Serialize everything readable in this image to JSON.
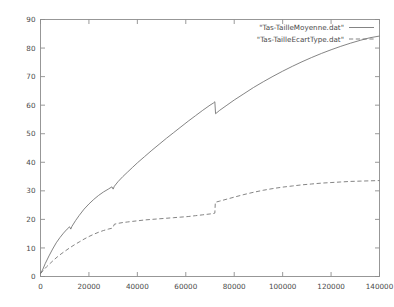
{
  "chart_data": {
    "type": "line",
    "title": "",
    "xlabel": "",
    "ylabel": "",
    "xlim": [
      0,
      140000
    ],
    "ylim": [
      0,
      90
    ],
    "grid": false,
    "legend_position": "top-right-inside",
    "xticks": [
      0,
      20000,
      40000,
      60000,
      80000,
      100000,
      120000,
      140000
    ],
    "xtick_labels": [
      "0",
      "20000",
      "40000",
      "60000",
      "80000",
      "100000",
      "120000",
      "140000"
    ],
    "yticks": [
      0,
      10,
      20,
      30,
      40,
      50,
      60,
      70,
      80,
      90
    ],
    "ytick_labels": [
      "0",
      "10",
      "20",
      "30",
      "40",
      "50",
      "60",
      "70",
      "80",
      "90"
    ],
    "series": [
      {
        "name": "\"Tas-TailleMoyenne.dat\"",
        "style": "solid",
        "color": "#6e6e6e",
        "x": [
          0,
          1000,
          2000,
          3500,
          5000,
          6500,
          8000,
          9500,
          11000,
          12000,
          12500,
          13000,
          14500,
          16000,
          18000,
          20000,
          22000,
          24000,
          26000,
          28000,
          29500,
          30000,
          30500,
          32000,
          34000,
          36000,
          38000,
          40000,
          43000,
          46000,
          49000,
          52000,
          55000,
          58000,
          61000,
          64000,
          67000,
          70000,
          71500,
          72000,
          72300,
          74000,
          77000,
          80000,
          84000,
          88000,
          92000,
          96000,
          100000,
          104000,
          108000,
          112000,
          116000,
          120000,
          124000,
          128000,
          132000,
          136000,
          140000
        ],
        "y": [
          1.0,
          2.6,
          4.6,
          7.2,
          9.6,
          11.8,
          13.6,
          15.2,
          16.6,
          17.4,
          16.6,
          17.6,
          19.6,
          21.4,
          23.6,
          25.4,
          27.0,
          28.4,
          29.6,
          30.6,
          31.4,
          30.6,
          31.6,
          33.2,
          35.0,
          36.6,
          38.2,
          39.8,
          42.0,
          44.2,
          46.3,
          48.4,
          50.4,
          52.4,
          54.4,
          56.3,
          58.2,
          60.0,
          60.8,
          61.2,
          57.0,
          58.2,
          60.0,
          61.8,
          64.0,
          66.2,
          68.2,
          70.1,
          71.9,
          73.6,
          75.2,
          76.7,
          78.1,
          79.4,
          80.6,
          81.7,
          82.7,
          83.6,
          84.2
        ]
      },
      {
        "name": "\"Tas-TailleEcartType.dat\"",
        "style": "dashed",
        "color": "#6e6e6e",
        "x": [
          0,
          1000,
          2500,
          4000,
          5500,
          7000,
          8500,
          10000,
          12000,
          14000,
          16000,
          18000,
          20000,
          22000,
          24000,
          26000,
          28000,
          29500,
          30000,
          30500,
          32000,
          34000,
          36000,
          38000,
          40000,
          43000,
          46000,
          49000,
          52000,
          55000,
          58000,
          61000,
          64000,
          67000,
          70000,
          71800,
          72000,
          72200,
          74000,
          77000,
          80000,
          84000,
          88000,
          92000,
          96000,
          100000,
          104000,
          108000,
          112000,
          116000,
          120000,
          124000,
          128000,
          132000,
          136000,
          140000
        ],
        "y": [
          1.0,
          2.0,
          3.4,
          4.6,
          5.8,
          6.9,
          7.9,
          8.8,
          10.0,
          11.1,
          12.1,
          13.1,
          14.0,
          14.8,
          15.5,
          16.1,
          16.6,
          16.9,
          17.3,
          18.3,
          18.6,
          18.9,
          19.1,
          19.3,
          19.5,
          19.8,
          20.0,
          20.2,
          20.4,
          20.6,
          20.8,
          21.0,
          21.3,
          21.6,
          21.9,
          22.1,
          22.2,
          26.0,
          26.4,
          27.1,
          27.8,
          28.7,
          29.5,
          30.2,
          30.8,
          31.3,
          31.7,
          32.1,
          32.4,
          32.7,
          32.9,
          33.1,
          33.3,
          33.4,
          33.5,
          33.6
        ]
      }
    ]
  },
  "legend": {
    "entries": [
      {
        "label": "\"Tas-TailleMoyenne.dat\"",
        "style": "solid"
      },
      {
        "label": "\"Tas-TailleEcartType.dat\"",
        "style": "dashed"
      }
    ]
  }
}
